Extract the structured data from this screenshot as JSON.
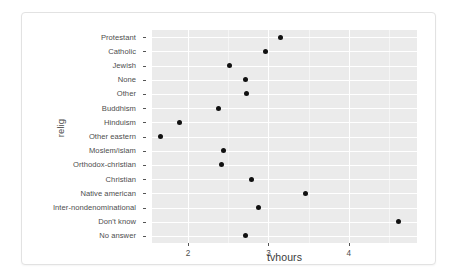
{
  "chart_data": {
    "type": "scatter",
    "title": "",
    "subtitle": "",
    "xlabel": "tvhours",
    "ylabel": "relig",
    "xlim": [
      1.55,
      4.85
    ],
    "ylim": [
      0,
      15
    ],
    "grid": true,
    "legend": "none",
    "x_ticks": [
      {
        "label": "2",
        "value": 2
      },
      {
        "label": "3",
        "value": 3
      },
      {
        "label": "4",
        "value": 4
      }
    ],
    "x_minor_ticks": [
      1.5,
      2.5,
      3.5,
      4.5
    ],
    "categories": [
      "Protestant",
      "Catholic",
      "Jewish",
      "None",
      "Other",
      "Buddhism",
      "Hinduism",
      "Other eastern",
      "Moslem/islam",
      "Orthodox-christian",
      "Christian",
      "Native american",
      "Inter-nondenominational",
      "Don't know",
      "No answer"
    ],
    "values": [
      3.15,
      2.96,
      2.52,
      2.71,
      2.73,
      2.38,
      1.89,
      1.65,
      2.44,
      2.42,
      2.79,
      3.46,
      2.87,
      4.62,
      2.72
    ],
    "points": [
      {
        "category": "Protestant",
        "tvhours": 3.15
      },
      {
        "category": "Catholic",
        "tvhours": 2.96
      },
      {
        "category": "Jewish",
        "tvhours": 2.52
      },
      {
        "category": "None",
        "tvhours": 2.71
      },
      {
        "category": "Other",
        "tvhours": 2.73
      },
      {
        "category": "Buddhism",
        "tvhours": 2.38
      },
      {
        "category": "Hinduism",
        "tvhours": 1.89
      },
      {
        "category": "Other eastern",
        "tvhours": 1.65
      },
      {
        "category": "Moslem/islam",
        "tvhours": 2.44
      },
      {
        "category": "Orthodox-christian",
        "tvhours": 2.42
      },
      {
        "category": "Christian",
        "tvhours": 2.79
      },
      {
        "category": "Native american",
        "tvhours": 3.46
      },
      {
        "category": "Inter-nondenominational",
        "tvhours": 2.87
      },
      {
        "category": "Don't know",
        "tvhours": 4.62
      },
      {
        "category": "No answer",
        "tvhours": 2.72
      }
    ],
    "colors": {
      "point": "#111111",
      "panel_background": "#ebebeb",
      "gridline_major": "#ffffff",
      "gridline_minor": "#f5f5f5",
      "axis_text": "#4d4d4d",
      "card_background": "#ffffff",
      "card_border": "#e2e2e2"
    }
  }
}
